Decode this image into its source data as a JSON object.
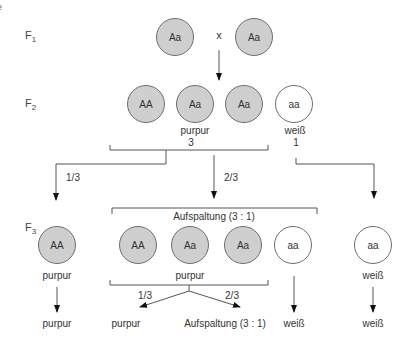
{
  "edge_fragments": [
    "e",
    ":"
  ],
  "generations": {
    "f1": {
      "label": "F",
      "sub": "1"
    },
    "f2": {
      "label": "F",
      "sub": "2"
    },
    "f3": {
      "label": "F",
      "sub": "3"
    }
  },
  "colors": {
    "purple_fill": "#cfcfcf",
    "white_fill": "#ffffff",
    "stroke": "#6e6e6e"
  },
  "f1": {
    "parents": [
      {
        "genotype": "Aa",
        "phenotype": "purpur"
      },
      {
        "genotype": "Aa",
        "phenotype": "purpur"
      }
    ],
    "cross_symbol": "x"
  },
  "f2": {
    "offspring": [
      {
        "genotype": "AA",
        "phenotype": "purpur"
      },
      {
        "genotype": "Aa",
        "phenotype": "purpur"
      },
      {
        "genotype": "Aa",
        "phenotype": "purpur"
      },
      {
        "genotype": "aa",
        "phenotype": "weiß"
      }
    ],
    "purple_label": "purpur",
    "purple_count": "3",
    "white_label": "weiß",
    "white_count": "1",
    "branch_left_fraction": "1/3",
    "branch_mid_fraction": "2/3"
  },
  "f3": {
    "segregation_label": "Aufspaltung (3 : 1)",
    "left": {
      "genotype": "AA",
      "phenotype": "purpur",
      "result": "purpur"
    },
    "segregating": [
      {
        "genotype": "AA"
      },
      {
        "genotype": "Aa"
      },
      {
        "genotype": "Aa"
      },
      {
        "genotype": "aa"
      }
    ],
    "segregating_purple_label": "purpur",
    "sub_left_fraction": "1/3",
    "sub_left_result": "purpur",
    "sub_right_fraction": "2/3",
    "sub_right_result": "Aufspaltung (3 : 1)",
    "segregating_white_result": "weiß",
    "right": {
      "genotype": "aa",
      "phenotype": "weiß",
      "result": "weiß"
    }
  }
}
